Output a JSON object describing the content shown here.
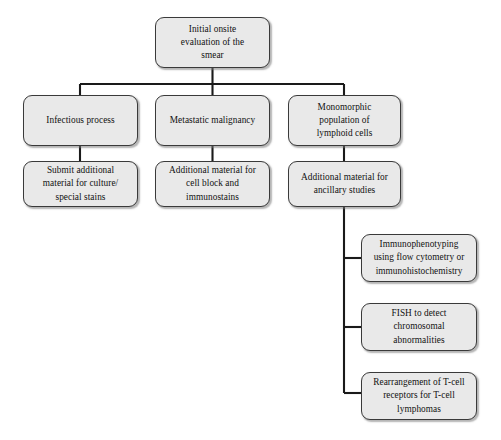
{
  "diagram": {
    "background_color": "#ffffff",
    "node_fill_color": "#e9e9e9",
    "node_border_color": "#3a3a3a",
    "connector_color": "#1a1a1a",
    "text_color": "#111111"
  },
  "nodes": {
    "root": {
      "label": "Initial onsite\nevaluation of the\nsmear"
    },
    "branch_infectious": {
      "label": "Infectious process"
    },
    "branch_metastatic": {
      "label": "Metastatic malignancy"
    },
    "branch_monomorphic": {
      "label": "Monomorphic\npopulation of\nlymphoid cells"
    },
    "action_infectious": {
      "label": "Submit additional\nmaterial for culture/\nspecial stains"
    },
    "action_metastatic": {
      "label": "Additional material for\ncell block and\nimmunostains"
    },
    "action_monomorphic": {
      "label": "Additional material for\nancillary studies"
    },
    "ancillary_immunophenotyping": {
      "label": "Immunophenotyping\nusing flow cytometry or\nimmunohistochemistry"
    },
    "ancillary_fish": {
      "label": "FISH to detect\nchromosomal\nabnormalities"
    },
    "ancillary_tcell": {
      "label": "Rearrangement of T-cell\nreceptors for T-cell\nlymphomas"
    }
  }
}
